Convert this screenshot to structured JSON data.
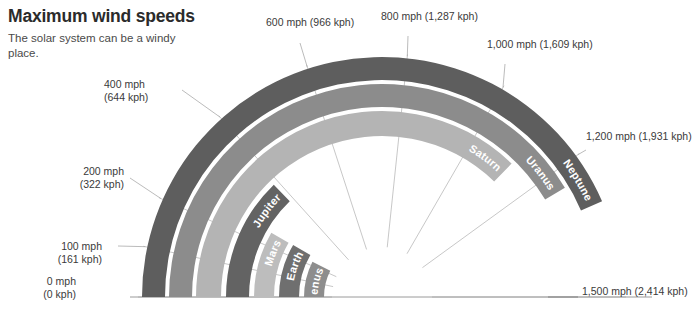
{
  "header": {
    "title": "Maximum wind speeds",
    "subtitle": "The solar system can be\na windy place."
  },
  "axis": {
    "ticks": [
      {
        "id": "t0",
        "mph": "0 mph",
        "kph": "(0 kph)",
        "value": 0
      },
      {
        "id": "t100",
        "mph": "100 mph",
        "kph": "(161 kph)",
        "value": 100
      },
      {
        "id": "t200",
        "mph": "200 mph",
        "kph": "(322 kph)",
        "value": 200
      },
      {
        "id": "t400",
        "mph": "400 mph",
        "kph": "(644 kph)",
        "value": 400
      },
      {
        "id": "t600",
        "mph": "600 mph",
        "kph": "(966 kph)",
        "value": 600
      },
      {
        "id": "t800",
        "mph": "800 mph",
        "kph": "(1,287 kph)",
        "value": 800
      },
      {
        "id": "t1000",
        "mph": "1,000 mph",
        "kph": "(1,609 kph)",
        "value": 1000
      },
      {
        "id": "t1200",
        "mph": "1,200 mph",
        "kph": "(1,931 kph)",
        "value": 1200
      },
      {
        "id": "t1500",
        "mph": "1,500 mph",
        "kph": "(2,414 kph)",
        "value": 1500
      }
    ]
  },
  "chart_data": {
    "type": "bar",
    "title": "Maximum wind speeds",
    "subtitle": "The solar system can be a windy place.",
    "chart_style": "polar-radial-bands",
    "categories": [
      "Venus",
      "Earth",
      "Mars",
      "Jupiter",
      "Saturn",
      "Uranus",
      "Neptune"
    ],
    "values": [
      224,
      253,
      251,
      384,
      1118,
      1243,
      1304
    ],
    "units": "mph",
    "xlabel": "",
    "ylabel": "Maximum wind speed (mph)",
    "xlim": [
      0,
      1500
    ],
    "grid": true,
    "legend": "none",
    "angular_range_deg": [
      180,
      0
    ],
    "series": [
      {
        "name": "Maximum wind speed (mph)",
        "values": [
          224,
          253,
          251,
          384,
          1118,
          1243,
          1304
        ]
      }
    ],
    "bands": [
      {
        "name": "Venus",
        "value": 224,
        "r_in": 58,
        "r_out": 78,
        "color": "#8d8d8d",
        "label_color": "#ffffff"
      },
      {
        "name": "Earth",
        "value": 253,
        "r_in": 83,
        "r_out": 103,
        "color": "#6f6f6f",
        "label_color": "#ffffff"
      },
      {
        "name": "Mars",
        "value": 251,
        "r_in": 108,
        "r_out": 128,
        "color": "#bdbdbd",
        "label_color": "#ffffff"
      },
      {
        "name": "Jupiter",
        "value": 384,
        "r_in": 133,
        "r_out": 156,
        "color": "#636363",
        "label_color": "#ffffff"
      },
      {
        "name": "Saturn",
        "value": 1118,
        "r_in": 161,
        "r_out": 186,
        "color": "#b4b4b4",
        "label_color": "#ffffff"
      },
      {
        "name": "Uranus",
        "value": 1243,
        "r_in": 190,
        "r_out": 213,
        "color": "#8c8c8c",
        "label_color": "#ffffff"
      },
      {
        "name": "Neptune",
        "value": 1304,
        "r_in": 217,
        "r_out": 240,
        "color": "#5e5e5e",
        "label_color": "#ffffff"
      }
    ]
  },
  "colors": {
    "title": "#2b2b2b",
    "text": "#3a3a3a",
    "baseline": "#9a9a9a",
    "gridline": "#b9b9b9",
    "leader": "#aaaaaa",
    "background": "#ffffff"
  }
}
